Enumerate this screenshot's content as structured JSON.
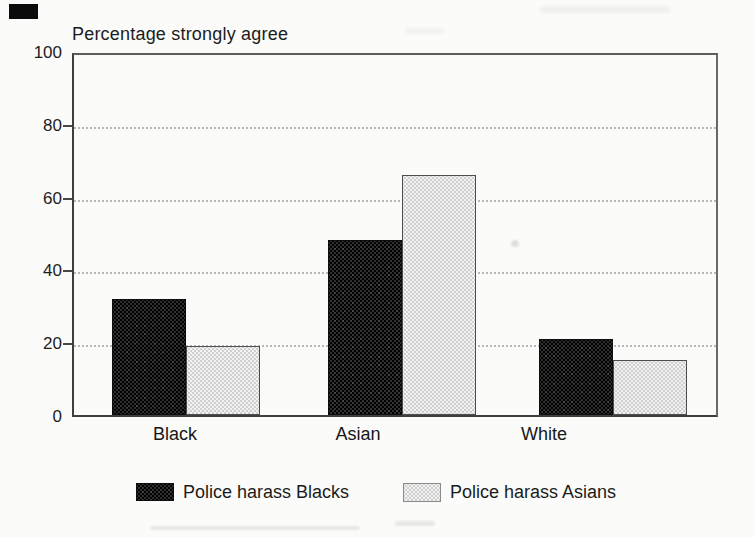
{
  "page": {
    "background": "#fbfbfa",
    "scan_artifact_color": "#0b0b0b"
  },
  "chart_data": {
    "type": "bar",
    "title": "Percentage strongly agree",
    "categories": [
      "Black",
      "Asian",
      "White"
    ],
    "series": [
      {
        "name": "Police harass Blacks",
        "swatch": "dark",
        "color": "#262626",
        "values": [
          32,
          48,
          21
        ]
      },
      {
        "name": "Police harass Asians",
        "swatch": "light",
        "color": "#e8e7e4",
        "values": [
          19,
          66,
          15
        ]
      }
    ],
    "xlabel": "",
    "ylabel": "Percentage strongly agree",
    "ylim": [
      0,
      100
    ],
    "yticks": [
      0,
      20,
      40,
      60,
      80,
      100
    ],
    "grid": {
      "horizontal_dotted_at": [
        20,
        40,
        60,
        80
      ],
      "color": "#b7b7b7"
    },
    "legend": {
      "position": "bottom",
      "items": [
        "Police harass Blacks",
        "Police harass Asians"
      ]
    },
    "axis_color": "#3f3f3f",
    "text_color": "#1c1c1c"
  }
}
